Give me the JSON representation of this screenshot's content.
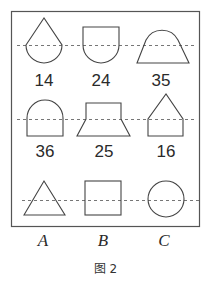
{
  "figure": {
    "caption": "图 2",
    "stroke_color": "#444444",
    "grid_items": [
      {
        "shape": "teardrop (triangle over semicircle)",
        "label": "14"
      },
      {
        "shape": "square over semicircle",
        "label": "24"
      },
      {
        "shape": "semicircle over trapezoid",
        "label": "35"
      },
      {
        "shape": "semicircle over rectangle",
        "label": "36"
      },
      {
        "shape": "rectangle over trapezoid",
        "label": "25"
      },
      {
        "shape": "triangle over rectangle",
        "label": "16"
      }
    ],
    "options": [
      {
        "shape": "triangle",
        "label": "A"
      },
      {
        "shape": "square",
        "label": "B"
      },
      {
        "shape": "circle",
        "label": "C"
      }
    ]
  }
}
